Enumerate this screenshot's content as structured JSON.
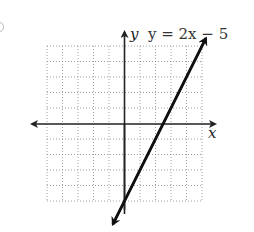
{
  "chart_data": {
    "type": "line",
    "title": "",
    "equation_label": "y = 2x − 5",
    "xlabel": "x",
    "ylabel": "y",
    "xlim": [
      -5,
      5
    ],
    "ylim": [
      -5,
      5
    ],
    "grid": true,
    "grid_style": "dotted",
    "tick_labels": false,
    "series": [
      {
        "name": "y = 2x − 5",
        "slope": 2,
        "intercept": -5,
        "points": [
          [
            -0.75,
            -6.5
          ],
          [
            0,
            -5
          ],
          [
            2.5,
            0
          ],
          [
            5,
            5
          ],
          [
            5.25,
            5.5
          ]
        ],
        "arrows_both_ends": true
      }
    ],
    "x_intercept": 2.5,
    "y_intercept": -5
  },
  "colors": {
    "line": "#111111",
    "axes": "#222222",
    "grid": "#888888"
  }
}
